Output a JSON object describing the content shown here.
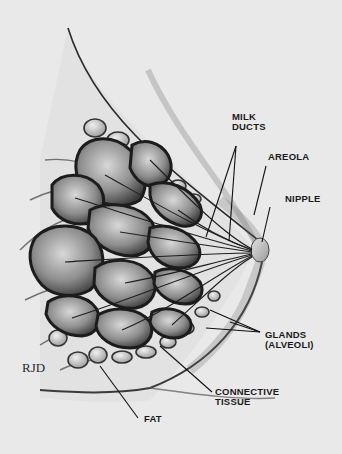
{
  "figure": {
    "signature": "RJD",
    "colors": {
      "background": "#e9e9e9",
      "ink": "#1a1a1a",
      "lobe_fill": "#7a7a7a",
      "lobe_light": "#c9c9c9",
      "skin": "#d2d2d2"
    }
  },
  "labels": {
    "milk_ducts": [
      "MILK",
      "DUCTS"
    ],
    "areola": "AREOLA",
    "nipple": "NIPPLE",
    "glands": [
      "GLANDS",
      "(ALVEOLI)"
    ],
    "connective_tissue": [
      "CONNECTIVE",
      "TISSUE"
    ],
    "fat": "FAT"
  }
}
